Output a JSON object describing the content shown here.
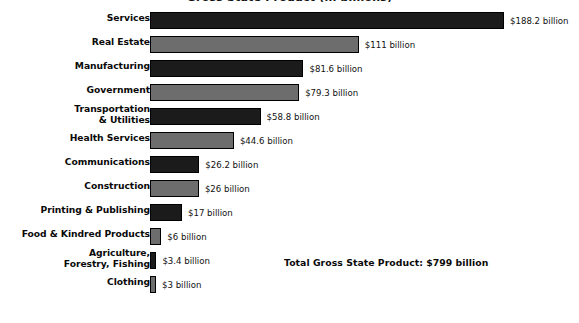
{
  "chart_data": {
    "type": "bar",
    "orientation": "horizontal",
    "title": "Gross State Product (in billions)",
    "xlabel": "",
    "ylabel": "",
    "xlim": [
      0,
      188.2
    ],
    "grid": false,
    "legend": false,
    "units": "billion US dollars",
    "categories": [
      "Services",
      "Real Estate",
      "Manufacturing",
      "Government",
      "Transportation & Utilities",
      "Health Services",
      "Communications",
      "Construction",
      "Printing & Publishing",
      "Food & Kindred Products",
      "Agriculture, Forestry, Fishing",
      "Clothing"
    ],
    "values": [
      188.2,
      111,
      81.6,
      79.3,
      58.8,
      44.6,
      26.2,
      26,
      17,
      6,
      3.4,
      3
    ],
    "bars": [
      {
        "label_line1": "Services",
        "label_line2": "",
        "value": 188.2,
        "value_label": "$188.2 billion",
        "shade": "dark"
      },
      {
        "label_line1": "Real Estate",
        "label_line2": "",
        "value": 111,
        "value_label": "$111 billion",
        "shade": "light"
      },
      {
        "label_line1": "Manufacturing",
        "label_line2": "",
        "value": 81.6,
        "value_label": "$81.6 billion",
        "shade": "dark"
      },
      {
        "label_line1": "Government",
        "label_line2": "",
        "value": 79.3,
        "value_label": "$79.3 billion",
        "shade": "light"
      },
      {
        "label_line1": "Transportation",
        "label_line2": "& Utilities",
        "value": 58.8,
        "value_label": "$58.8 billion",
        "shade": "dark"
      },
      {
        "label_line1": "Health Services",
        "label_line2": "",
        "value": 44.6,
        "value_label": "$44.6 billion",
        "shade": "light"
      },
      {
        "label_line1": "Communications",
        "label_line2": "",
        "value": 26.2,
        "value_label": "$26.2 billion",
        "shade": "dark"
      },
      {
        "label_line1": "Construction",
        "label_line2": "",
        "value": 26,
        "value_label": "$26 billion",
        "shade": "light"
      },
      {
        "label_line1": "Printing & Publishing",
        "label_line2": "",
        "value": 17,
        "value_label": "$17 billion",
        "shade": "dark"
      },
      {
        "label_line1": "Food & Kindred Products",
        "label_line2": "",
        "value": 6,
        "value_label": "$6 billion",
        "shade": "light"
      },
      {
        "label_line1": "Agriculture,",
        "label_line2": "Forestry, Fishing",
        "value": 3.4,
        "value_label": "$3.4 billion",
        "shade": "dark"
      },
      {
        "label_line1": "Clothing",
        "label_line2": "",
        "value": 3,
        "value_label": "$3 billion",
        "shade": "light"
      }
    ],
    "annotations": [
      {
        "text": "Total Gross State Product: $799 billion"
      }
    ],
    "colors": {
      "bar_dark": "#1b1b1b",
      "bar_light": "#6d6d6d",
      "bar_border": "#000000",
      "background": "#ffffff",
      "text": "#0a0a0a"
    }
  },
  "total_note": "Total Gross State Product: $799 billion"
}
